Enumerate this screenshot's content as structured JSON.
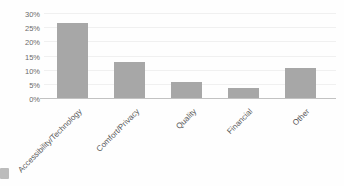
{
  "chart_data": {
    "type": "bar",
    "title": "",
    "xlabel": "",
    "ylabel": "",
    "categories": [
      "Accessibility/Technology",
      "Comfort/Privacy",
      "Quality",
      "Financial",
      "Other"
    ],
    "values": [
      27,
      13,
      6,
      4,
      11
    ],
    "value_unit": "%",
    "ylim": [
      0,
      30
    ],
    "ytick_values": [
      0,
      5,
      10,
      15,
      20,
      25,
      30
    ],
    "ytick_labels": [
      "0%",
      "5%",
      "10%",
      "15%",
      "20%",
      "25%",
      "30%"
    ],
    "grid": true,
    "legend": false,
    "x_labels_rotation_deg": -45,
    "colors": {
      "bar_fill": "#a7a7a7",
      "axis_line": "#c2c2c2",
      "gridline": "#f0f0f0",
      "ytick_label": "#6a6a6a",
      "category_label": "#565656",
      "background": "#fefefe"
    }
  }
}
